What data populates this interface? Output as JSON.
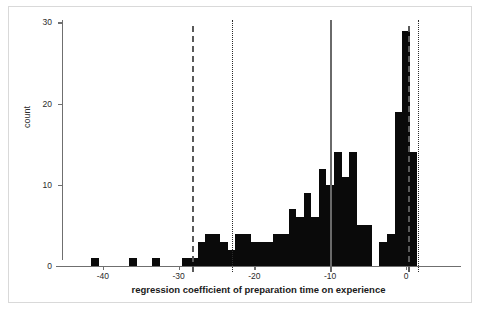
{
  "figure": {
    "width": 481,
    "height": 311,
    "background": "#ffffff",
    "border_color": "#d9d9d9"
  },
  "chart_data": {
    "type": "bar",
    "subtype": "histogram",
    "title": "",
    "xlabel": "regression coefficient of preparation time on experience",
    "ylabel": "count",
    "xlim": [
      -46,
      4.5
    ],
    "ylim": [
      0,
      31
    ],
    "grid": false,
    "legend": null,
    "bar_color": "#0a0a0a",
    "bin_width": 1,
    "xticks": [
      -40,
      -30,
      -20,
      -10,
      0
    ],
    "xtick_labels": [
      "-40",
      "-30",
      "-20",
      "-10",
      "0"
    ],
    "yticks": [
      0,
      10,
      20,
      30
    ],
    "ytick_labels": [
      "0",
      "10",
      "20",
      "30"
    ],
    "bins": [
      {
        "x": -41,
        "count": 1
      },
      {
        "x": -36,
        "count": 1
      },
      {
        "x": -33,
        "count": 1
      },
      {
        "x": -29,
        "count": 1
      },
      {
        "x": -28,
        "count": 1
      },
      {
        "x": -27,
        "count": 3
      },
      {
        "x": -26,
        "count": 4
      },
      {
        "x": -25,
        "count": 4
      },
      {
        "x": -24,
        "count": 3
      },
      {
        "x": -23,
        "count": 2
      },
      {
        "x": -22,
        "count": 4
      },
      {
        "x": -21,
        "count": 4
      },
      {
        "x": -20,
        "count": 3
      },
      {
        "x": -19,
        "count": 3
      },
      {
        "x": -18,
        "count": 3
      },
      {
        "x": -17,
        "count": 4
      },
      {
        "x": -16,
        "count": 4
      },
      {
        "x": -15,
        "count": 7
      },
      {
        "x": -14,
        "count": 6
      },
      {
        "x": -13,
        "count": 9
      },
      {
        "x": -12,
        "count": 6
      },
      {
        "x": -11,
        "count": 12
      },
      {
        "x": -10,
        "count": 10
      },
      {
        "x": -9,
        "count": 14
      },
      {
        "x": -8,
        "count": 11
      },
      {
        "x": -7,
        "count": 14
      },
      {
        "x": -6,
        "count": 5
      },
      {
        "x": -5,
        "count": 5
      },
      {
        "x": -4,
        "count": 0
      },
      {
        "x": -3,
        "count": 3
      },
      {
        "x": -2,
        "count": 4
      },
      {
        "x": -1,
        "count": 19
      },
      {
        "x": 0,
        "count": 29
      },
      {
        "x": 1,
        "count": 14
      }
    ],
    "reference_lines": [
      {
        "name": "lower-ci-dashed",
        "x": -28.2,
        "style": "dashed",
        "color": "#5a5a5a"
      },
      {
        "name": "lower-inner-dotted",
        "x": -22.9,
        "style": "dotted",
        "color": "#2a2a2a"
      },
      {
        "name": "point-estimate-solid",
        "x": -10.0,
        "style": "solid",
        "color": "#6a6a6a"
      },
      {
        "name": "upper-ci-dashed",
        "x": 0.2,
        "style": "dashed",
        "color": "#4a4a4a"
      },
      {
        "name": "upper-inner-dotted",
        "x": 1.6,
        "style": "dotted",
        "color": "#2a2a2a"
      }
    ]
  }
}
